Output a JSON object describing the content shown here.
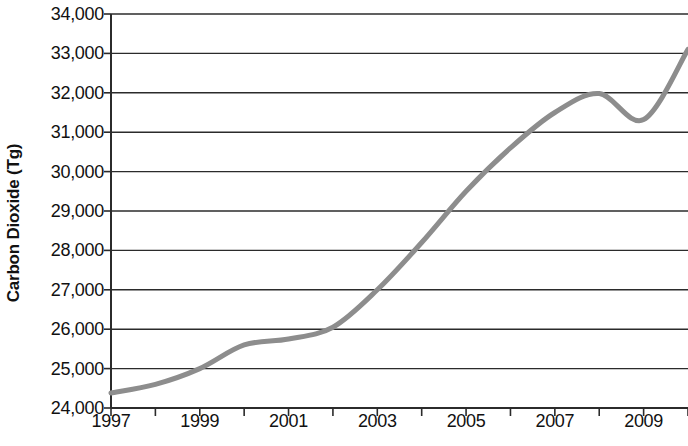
{
  "chart_data": {
    "type": "line",
    "title": "",
    "subtitle": "",
    "xlabel": "",
    "ylabel": "Carbon Dioxide (Tg)",
    "xlim": [
      1997,
      2010
    ],
    "ylim": [
      24000,
      34000
    ],
    "grid": true,
    "grid_axis": "y",
    "legend": false,
    "legend_position": "none",
    "line_color": "#8d8d8d",
    "line_width": 5,
    "axis_color": "#2b2b2b",
    "gridline_color": "#2b2b2b",
    "text_color": "#111111",
    "background_color": "#ffffff",
    "y_ticks": [
      24000,
      25000,
      26000,
      27000,
      28000,
      29000,
      30000,
      31000,
      32000,
      33000,
      34000
    ],
    "y_tick_labels": [
      "24,000",
      "25,000",
      "26,000",
      "27,000",
      "28,000",
      "29,000",
      "30,000",
      "31,000",
      "32,000",
      "33,000",
      "34,000"
    ],
    "x_ticks": [
      1997,
      1998,
      1999,
      2000,
      2001,
      2002,
      2003,
      2004,
      2005,
      2006,
      2007,
      2008,
      2009,
      2010
    ],
    "x_tick_labels": [
      "1997",
      "",
      "1999",
      "",
      "2001",
      "",
      "2003",
      "",
      "2005",
      "",
      "2007",
      "",
      "2009",
      ""
    ],
    "x_labeled_ticks": [
      {
        "x": 1997,
        "label": "1997"
      },
      {
        "x": 1999,
        "label": "1999"
      },
      {
        "x": 2001,
        "label": "2001"
      },
      {
        "x": 2003,
        "label": "2003"
      },
      {
        "x": 2005,
        "label": "2005"
      },
      {
        "x": 2007,
        "label": "2007"
      },
      {
        "x": 2009,
        "label": "2009"
      }
    ],
    "series": [
      {
        "name": "Carbon Dioxide",
        "x": [
          1997,
          1998,
          1999,
          2000,
          2001,
          2002,
          2003,
          2004,
          2005,
          2006,
          2007,
          2008,
          2009,
          2010
        ],
        "values": [
          24380,
          24600,
          25000,
          25600,
          25750,
          26050,
          27000,
          28200,
          29500,
          30600,
          31500,
          31980,
          31320,
          33100
        ]
      }
    ]
  }
}
